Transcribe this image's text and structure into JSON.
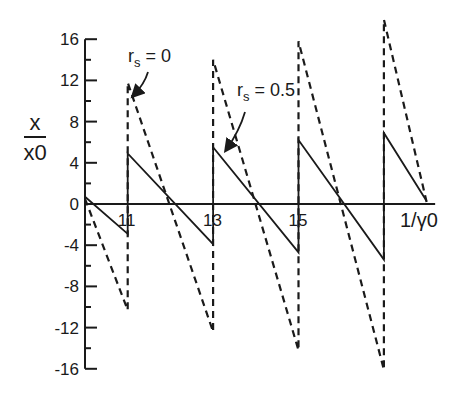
{
  "chart_data": {
    "type": "line",
    "title": "",
    "xlabel": "1/γ0",
    "ylabel": "x / x0",
    "ylabel_num": "x",
    "ylabel_den": "x0",
    "xlim": [
      10,
      18.2
    ],
    "ylim": [
      -16,
      16
    ],
    "grid": false,
    "legend": "none (inline annotations)",
    "x_ticks": [
      11,
      13,
      15
    ],
    "x_tick_labels": [
      "11",
      "13",
      "15"
    ],
    "x_axis_end_label": "1/γ0",
    "y_ticks": [
      16,
      12,
      8,
      4,
      0,
      -4,
      -8,
      -12,
      -16
    ],
    "y_tick_labels": [
      "16",
      "12",
      "8",
      "4",
      "0",
      "-4",
      "-8",
      "-12",
      "-16"
    ],
    "y_minor_ticks": [
      14,
      10,
      6,
      2,
      -2,
      -6,
      -10,
      -14
    ],
    "series": [
      {
        "name": "rs = 0",
        "style": "dashed",
        "x": [
          10.0,
          11.0,
          11.0,
          13.0,
          13.0,
          15.0,
          15.0,
          17.0,
          17.0,
          18.0
        ],
        "y": [
          0.5,
          -10.3,
          11.8,
          -12.4,
          14.0,
          -14.2,
          15.8,
          -16.1,
          17.9,
          0.2
        ]
      },
      {
        "name": "rs = 0.5",
        "style": "solid",
        "x": [
          10.0,
          11.0,
          11.0,
          13.0,
          13.0,
          15.0,
          15.0,
          17.0,
          17.0,
          18.0
        ],
        "y": [
          0.7,
          -2.9,
          4.9,
          -3.9,
          5.5,
          -4.7,
          6.2,
          -5.4,
          6.9,
          0.3
        ]
      }
    ],
    "annotations": [
      {
        "text_main": "r",
        "text_sub": "s",
        "text_rest": " = 0",
        "label": "rs = 0",
        "x": 128,
        "y": 62,
        "arrow_from": [
          148,
          72
        ],
        "arrow_to": [
          133,
          96
        ]
      },
      {
        "text_main": "r",
        "text_sub": "s",
        "text_rest": " = 0.5",
        "label": "rs = 0.5",
        "x": 237,
        "y": 96,
        "arrow_from": [
          245,
          112
        ],
        "arrow_to": [
          226,
          150
        ]
      }
    ]
  }
}
